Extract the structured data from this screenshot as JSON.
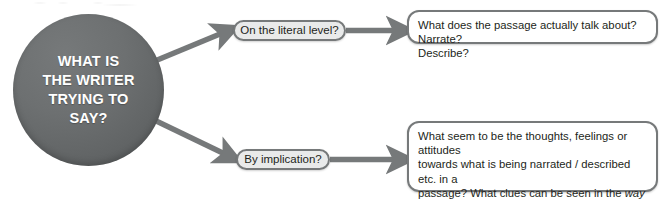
{
  "diagram": {
    "title": "What is the writer trying to say?",
    "hub": {
      "label": "WHAT IS\nTHE WRITER\nTRYING TO\nSAY?",
      "shape": "circle",
      "fill_color": "#6d7071",
      "text_color": "#ffffff"
    },
    "branches": [
      {
        "id": "literal",
        "pill_label": "On the literal level?",
        "answer_lines": [
          "What does the passage actually talk about? Narrate?",
          "Describe?"
        ],
        "answer_plain": "What does the passage actually talk about? Narrate? Describe?",
        "emphasis": []
      },
      {
        "id": "implication",
        "pill_label": "By implication?",
        "answer_lines": [
          "What seem to be the thoughts, feelings or attitudes",
          "towards what is being narrated / described etc. in a",
          "passage? What clues can be seen in the way the",
          "passage is written – the aspects of language and",
          "style that have been chosen and used?"
        ],
        "answer_plain": "What seem to be the thoughts, feelings or attitudes towards what is being narrated / described etc. in a passage? What clues can be seen in the way the passage is written – the aspects of language and style that have been chosen and used?",
        "emphasis": [
          "way"
        ]
      }
    ],
    "connectors": [
      {
        "name": "hub-to-literal-pill",
        "type": "arrow"
      },
      {
        "name": "literal-pill-to-answer",
        "type": "arrow"
      },
      {
        "name": "hub-to-implication-pill",
        "type": "arrow"
      },
      {
        "name": "implication-pill-to-answer",
        "type": "arrow"
      }
    ],
    "colors": {
      "stroke": "#76797a",
      "pill_fill": "#e9eaea",
      "box_fill": "#ffffff",
      "text": "#231f20"
    }
  }
}
